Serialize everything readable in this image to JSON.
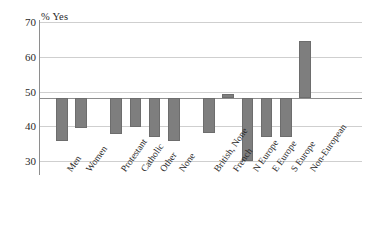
{
  "chart_data": {
    "type": "bar",
    "title": "",
    "subtitle": "",
    "xlabel": "",
    "ylabel": "% Yes",
    "ylim": [
      28,
      70
    ],
    "yticks": [
      30,
      40,
      50,
      60,
      70
    ],
    "grid": true,
    "legend": null,
    "baseline": 48,
    "bar_color": "#7e7e7e",
    "note": "Bars are drawn as deviations from a reference line at 48% Yes; each bar spans from the baseline to its value.",
    "categories": [
      "Men",
      "Women",
      "Protestant",
      "Catholic",
      "Other",
      "None",
      "British, None",
      "French",
      "N Europe",
      "E Europe",
      "S Europe",
      "Non-European"
    ],
    "values": [
      35.8,
      39.5,
      37.8,
      39.8,
      36.8,
      35.8,
      38.0,
      49.2,
      30.0,
      37.0,
      37.0,
      64.5
    ],
    "groups": [
      {
        "name": "Sex",
        "categories": [
          "Men",
          "Women"
        ]
      },
      {
        "name": "Religion",
        "categories": [
          "Protestant",
          "Catholic",
          "Other",
          "None"
        ]
      },
      {
        "name": "Origin",
        "categories": [
          "British, None",
          "French",
          "N Europe",
          "E Europe",
          "S Europe",
          "Non-European"
        ]
      }
    ]
  },
  "axis": {
    "y_title": "% Yes",
    "tick_30": "30",
    "tick_40": "40",
    "tick_50": "50",
    "tick_60": "60",
    "tick_70": "70"
  },
  "labels": {
    "c0": "Men",
    "c1": "Women",
    "c2": "Protestant",
    "c3": "Catholic",
    "c4": "Other",
    "c5": "None",
    "c6": "British, None",
    "c7": "French",
    "c8": "N Europe",
    "c9": "E Europe",
    "c10": "S Europe",
    "c11": "Non-European"
  }
}
